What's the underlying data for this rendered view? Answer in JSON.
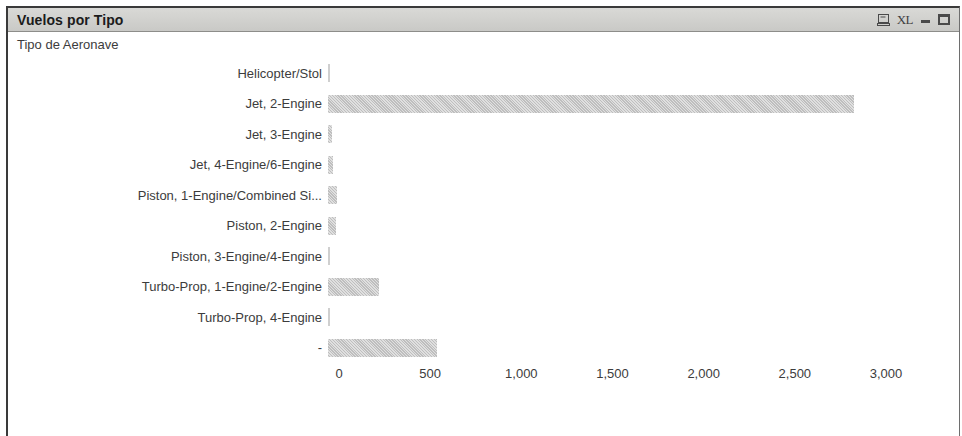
{
  "panel": {
    "title": "Vuelos por Tipo",
    "subtitle": "Tipo de Aeronave",
    "buttons": [
      {
        "name": "report-icon",
        "label": ""
      },
      {
        "name": "excel-export-icon",
        "label": "XL"
      },
      {
        "name": "minimize-button",
        "label": ""
      },
      {
        "name": "maximize-button",
        "label": ""
      }
    ]
  },
  "colors": {
    "bar": "#c6c6c6",
    "title_bar": "#d2d2cf",
    "text": "#3c3c3c",
    "border": "#3a3a3a"
  },
  "chart_data": {
    "type": "bar",
    "orientation": "horizontal",
    "title": "Vuelos por Tipo",
    "subtitle": "Tipo de Aeronave",
    "xlabel": "",
    "ylabel": "Tipo de Aeronave",
    "xlim": [
      0,
      3000
    ],
    "xticks": [
      0,
      500,
      1000,
      1500,
      2000,
      2500,
      3000
    ],
    "xtick_labels": [
      "0",
      "500",
      "1,000",
      "1,500",
      "2,000",
      "2,500",
      "3,000"
    ],
    "grid": false,
    "legend": null,
    "categories": [
      "Helicopter/Stol",
      "Jet, 2-Engine",
      "Jet, 3-Engine",
      "Jet, 4-Engine/6-Engine",
      "Piston, 1-Engine/Combined Si...",
      "Piston, 2-Engine",
      "Piston, 3-Engine/4-Engine",
      "Turbo-Prop, 1-Engine/2-Engine",
      "Turbo-Prop, 4-Engine",
      "-"
    ],
    "values": [
      6,
      2885,
      22,
      30,
      50,
      44,
      5,
      280,
      5,
      600
    ]
  }
}
